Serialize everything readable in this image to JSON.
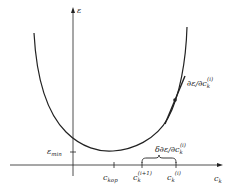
{
  "diagram": {
    "type": "gradient-descent-error-curve",
    "axes": {
      "y_label": "ε",
      "x_label": "c",
      "x_label_sub": "k"
    },
    "y_ticks": [
      {
        "label": "ε",
        "sub": "min"
      }
    ],
    "x_ticks": [
      {
        "label": "c",
        "sub": "kop"
      },
      {
        "label": "c",
        "sub": "k",
        "sup": "(i+1)"
      },
      {
        "label": "c",
        "sub": "k",
        "sup": "(i)"
      }
    ],
    "annotations": {
      "gradient": {
        "prefix": "∂ε/∂c",
        "sub": "k",
        "sup": "(i)"
      },
      "step": {
        "prefix": "δ∂ε/∂c",
        "sub": "k",
        "sup": "(i)"
      }
    },
    "colors": {
      "line": "#222222",
      "background": "#ffffff"
    }
  }
}
